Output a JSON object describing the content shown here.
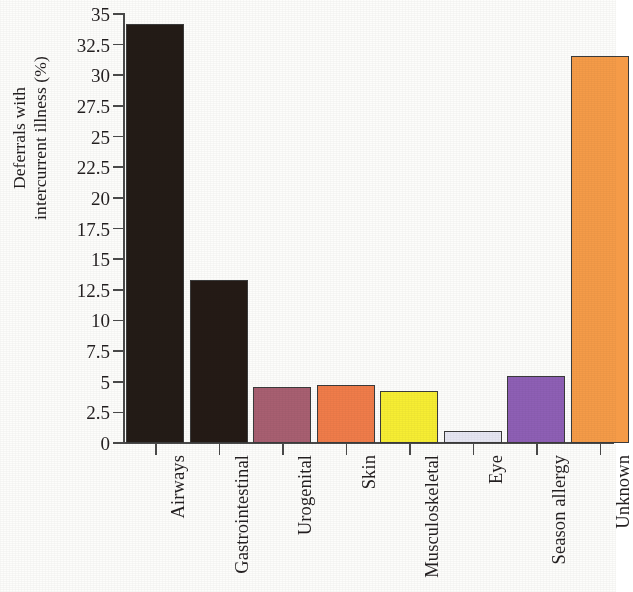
{
  "chart_data": {
    "type": "bar",
    "title": "",
    "xlabel": "",
    "ylabel_lines": [
      "Deferrals with",
      "intercurrent illness (%)"
    ],
    "ylabel": "Deferrals with intercurrent illness (%)",
    "ylim": [
      0,
      35
    ],
    "ytick_step": 2.5,
    "grid": false,
    "legend": "none",
    "categories": [
      "Airways",
      "Gastrointestinal",
      "Urogenital",
      "Skin",
      "Musculoskeletal",
      "Eye",
      "Season allergy",
      "Unknown"
    ],
    "values": [
      34.2,
      13.3,
      4.6,
      4.75,
      4.25,
      0.95,
      5.5,
      31.6
    ],
    "bar_colors": [
      "#231b16",
      "#241a15",
      "#a85f71",
      "#f07c4a",
      "#f7ee33",
      "#e6e6f2",
      "#8e5fb5",
      "#f59b48"
    ],
    "bar_edge_color": "#3b3b3b",
    "ytick_labels": [
      "0",
      "2.5",
      "5",
      "7.5",
      "10",
      "12.5",
      "15",
      "17.5",
      "20",
      "22.5",
      "25",
      "27.5",
      "30",
      "32.5",
      "35"
    ],
    "ytick_values": [
      0,
      2.5,
      5,
      7.5,
      10,
      12.5,
      15,
      17.5,
      20,
      22.5,
      25,
      27.5,
      30,
      32.5,
      35
    ]
  }
}
